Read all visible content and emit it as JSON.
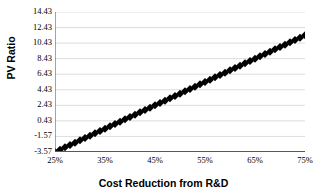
{
  "chart_data": {
    "type": "scatter",
    "title": "",
    "xlabel": "Cost Reduction from R&D",
    "ylabel": "PV Ratio",
    "xlim": [
      25,
      75
    ],
    "ylim": [
      -3.57,
      14.43
    ],
    "grid": true,
    "grid_axis": "y",
    "legend": false,
    "marker": "diamond",
    "marker_color": "#000000",
    "marker_size": 4,
    "x_tick_labels": [
      "25%",
      "35%",
      "45%",
      "55%",
      "65%",
      "75%"
    ],
    "x_tick_values": [
      25,
      35,
      45,
      55,
      65,
      75
    ],
    "y_tick_labels": [
      "14.43",
      "12.43",
      "10.43",
      "8.43",
      "6.43",
      "4.43",
      "2.43",
      "0.43",
      "-1.57",
      "-3.57"
    ],
    "y_tick_values": [
      14.43,
      12.43,
      10.43,
      8.43,
      6.43,
      4.43,
      2.43,
      0.43,
      -1.57,
      -3.57
    ],
    "series": [
      {
        "name": "PV Ratio",
        "x": [
          25,
          26,
          27,
          28,
          29,
          30,
          31,
          32,
          33,
          34,
          35,
          36,
          37,
          38,
          39,
          40,
          41,
          42,
          43,
          44,
          45,
          46,
          47,
          48,
          49,
          50,
          51,
          52,
          53,
          54,
          55,
          56,
          57,
          58,
          59,
          60,
          61,
          62,
          63,
          64,
          65,
          66,
          67,
          68,
          69,
          70,
          71,
          72,
          73,
          74,
          75
        ],
        "values": [
          -3.57,
          -3.27,
          -2.97,
          -2.67,
          -2.37,
          -2.07,
          -1.77,
          -1.47,
          -1.17,
          -0.87,
          -0.57,
          -0.27,
          0.03,
          0.33,
          0.63,
          0.93,
          1.23,
          1.53,
          1.83,
          2.13,
          2.43,
          2.73,
          3.03,
          3.33,
          3.63,
          3.93,
          4.23,
          4.53,
          4.83,
          5.13,
          5.43,
          5.73,
          6.03,
          6.33,
          6.63,
          6.93,
          7.23,
          7.53,
          7.83,
          8.13,
          8.43,
          8.73,
          9.03,
          9.33,
          9.63,
          9.93,
          10.23,
          10.53,
          10.83,
          11.13,
          11.43
        ]
      }
    ]
  },
  "style": {
    "background": "#ffffff",
    "gridline_color": "#d9d9d9",
    "axis_color": "#595959",
    "text_color": "#000000"
  }
}
